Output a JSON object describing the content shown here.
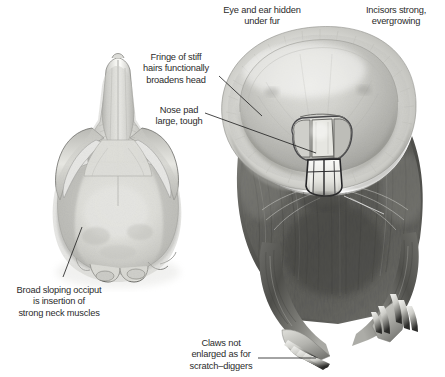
{
  "figure": {
    "background_color": "#ffffff",
    "text_color": "#2b2b2b",
    "leader_color": "#1b1b1b"
  },
  "specimens": [
    {
      "id": "skull",
      "name": "mole-skull-dorsal-view",
      "view": "dorsal (top) view of skull",
      "medium": "pencil / graphite shading"
    },
    {
      "id": "head",
      "name": "mole-head-frontal-view",
      "view": "frontal view of head with forelimbs",
      "medium": "pencil / graphite shading"
    }
  ],
  "annotations": [
    {
      "id": "eye-ear",
      "label": "Eye and ear hidden\nunder fur",
      "align": "center",
      "x": 206,
      "y": 5,
      "w": 112,
      "has_leader": false
    },
    {
      "id": "incisors",
      "label": "Incisors strong,\nevergrowing",
      "align": "center",
      "x": 348,
      "y": 5,
      "w": 96,
      "has_leader": true,
      "leader_style": "light"
    },
    {
      "id": "fringe",
      "label": "Fringe of stiff\nhairs functionally\nbroadens head",
      "align": "center",
      "x": 134,
      "y": 52,
      "w": 84,
      "has_leader": true,
      "leader_style": "dark"
    },
    {
      "id": "nose-pad",
      "label": "Nose pad\nlarge, tough",
      "align": "center",
      "x": 140,
      "y": 105,
      "w": 78,
      "has_leader": true,
      "leader_style": "dark"
    },
    {
      "id": "occiput",
      "label": "Broad sloping occiput\nis insertion of\nstrong neck muscles",
      "align": "center",
      "x": 2,
      "y": 285,
      "w": 114,
      "has_leader": true,
      "leader_style": "dark"
    },
    {
      "id": "claws",
      "label": "Claws not\nenlarged as for\nscratch–diggers",
      "align": "center",
      "x": 178,
      "y": 338,
      "w": 86,
      "has_leader": true,
      "leader_style": "dark"
    }
  ]
}
